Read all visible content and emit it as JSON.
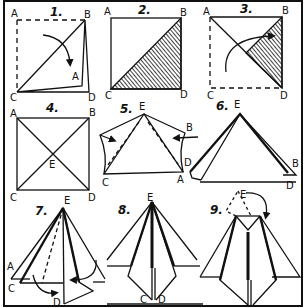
{
  "steps": [
    {
      "number": "1.",
      "labels": {
        "A": "A",
        "B": "B",
        "C": "C",
        "D": "D",
        "A2": "A"
      }
    },
    {
      "number": "2.",
      "labels": {
        "A": "A",
        "B": "B",
        "C": "C",
        "D": "D"
      }
    },
    {
      "number": "3.",
      "labels": {
        "A": "A",
        "B": "B",
        "C": "C",
        "D": "D"
      }
    },
    {
      "number": "4.",
      "labels": {
        "A": "A",
        "B": "B",
        "C": "C",
        "D": "D",
        "E": "E"
      }
    },
    {
      "number": "5.",
      "labels": {
        "E": "E",
        "B": "B",
        "D": "D",
        "A": "A",
        "C": "C"
      }
    },
    {
      "number": "6.",
      "labels": {
        "E": "E",
        "B": "B",
        "D": "D"
      }
    },
    {
      "number": "7.",
      "labels": {
        "E": "E",
        "A": "A",
        "C": "C",
        "D": "D",
        "B": "B"
      }
    },
    {
      "number": "8.",
      "labels": {
        "E": "E",
        "C": "C",
        "D": "D"
      }
    },
    {
      "number": "9.",
      "labels": {
        "E": "E"
      }
    }
  ],
  "colors": {
    "ink": "#111111",
    "paper": "#ffffff"
  }
}
